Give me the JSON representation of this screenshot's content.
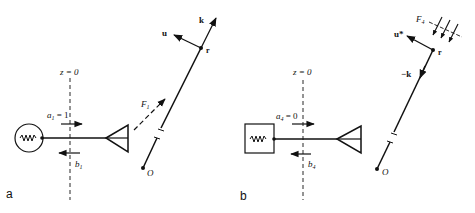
{
  "panels": [
    {
      "id": "a",
      "panel_label": "a",
      "plane_label": "z = 0",
      "incident_label": "a",
      "incident_sub": "1",
      "incident_value": " = 1",
      "reflected_label": "b",
      "reflected_sub": "1",
      "source_type": "generator (circle with resistor)",
      "field_label": "F",
      "field_sub": "1",
      "vector_u": "u",
      "vector_k": "k",
      "point_r": "r",
      "origin": "O"
    },
    {
      "id": "b",
      "panel_label": "b",
      "plane_label": "z = 0",
      "incident_label": "a",
      "incident_sub": "4",
      "incident_value": " = 0",
      "reflected_label": "b",
      "reflected_sub": "4",
      "source_type": "matched load (box with resistor)",
      "field_label": "F",
      "field_sub": "4",
      "vector_u": "u*",
      "vector_k": "−k",
      "point_r": "r",
      "origin": "O"
    }
  ],
  "colors": {
    "ink": "#111111",
    "background": "#ffffff"
  }
}
